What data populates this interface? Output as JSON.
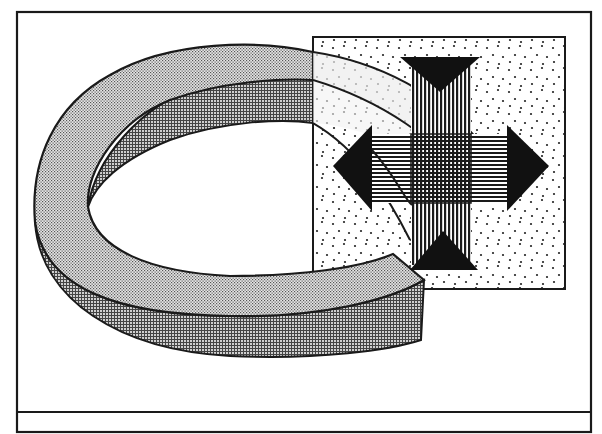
{
  "figure": {
    "kind": "line-art illustration",
    "colors": {
      "ink": "#1a1a1a",
      "paper": "#ffffff",
      "c_top_face": "#c8c8c8",
      "c_side_face": "#9a9a9a",
      "stipple_dot": "#222222"
    },
    "elements": {
      "frame": {
        "x": 17,
        "y": 12,
        "width": 574,
        "height": 400
      },
      "divider_y": 412,
      "stippled_square": {
        "x": 313,
        "y": 37,
        "width": 252,
        "height": 252
      },
      "cross": {
        "vertical_bar": {
          "x": 411,
          "y": 60,
          "width": 60,
          "height": 205
        },
        "horizontal_bar": {
          "x": 370,
          "y": 134,
          "width": 140,
          "height": 69
        },
        "arrowheads": [
          "up-to-down",
          "left",
          "right",
          "bottom-to-up"
        ]
      },
      "letter": "C"
    }
  }
}
